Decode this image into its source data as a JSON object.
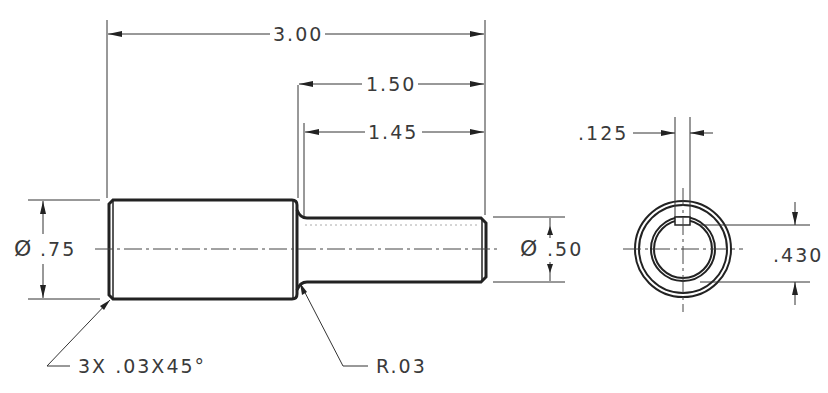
{
  "drawing": {
    "title": "Shaft with keyway - engineering drawing",
    "line_color": "#222222",
    "text_color": "#3a3a3a",
    "background": "#ffffff"
  },
  "dimensions": {
    "overall_length": "3.00",
    "small_shoulder_to_end": "1.50",
    "small_length": "1.45",
    "large_diameter_symbol": "Ø",
    "large_diameter": ".75",
    "small_diameter_symbol": "Ø",
    "small_diameter": ".50",
    "keyway_width": ".125",
    "keyway_depth_dim": ".430"
  },
  "notes": {
    "chamfer": "3X .03X45°",
    "fillet": "R.03"
  },
  "views": {
    "side_view": "front elevation",
    "end_view": "end section view"
  }
}
